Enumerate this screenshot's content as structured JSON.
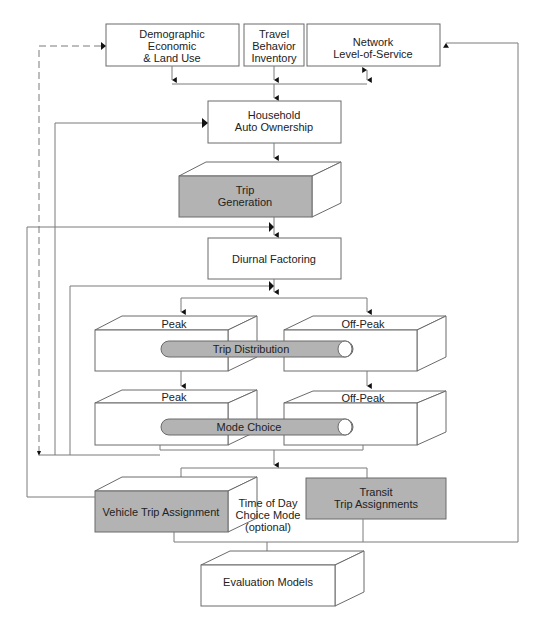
{
  "diagram": {
    "type": "flowchart",
    "title": "",
    "colors": {
      "box_fill": "#ffffff",
      "shaded_fill": "#b3b3b3",
      "stroke": "#6a6a6a",
      "arrow": "#111111"
    },
    "inputs": {
      "demographic": [
        "Demographic",
        "Economic",
        "& Land Use"
      ],
      "travel": [
        "Travel",
        "Behavior",
        "Inventory"
      ],
      "network": [
        "Network",
        "Level-of-Service"
      ]
    },
    "household": [
      "Household",
      "Auto Ownership"
    ],
    "trip_generation": [
      "Trip",
      "Generation"
    ],
    "diurnal": "Diurnal Factoring",
    "distribution": {
      "peak": "Peak",
      "offpeak": "Off-Peak",
      "label": "Trip Distribution"
    },
    "mode": {
      "peak": "Peak",
      "offpeak": "Off-Peak",
      "label": "Mode Choice"
    },
    "vehicle_assignment": "Vehicle Trip Assignment",
    "time_of_day_note": [
      "Time of Day",
      "Choice Mode",
      "(optional)"
    ],
    "transit_assignment": [
      "Transit",
      "Trip Assignments"
    ],
    "evaluation": "Evaluation Models"
  }
}
